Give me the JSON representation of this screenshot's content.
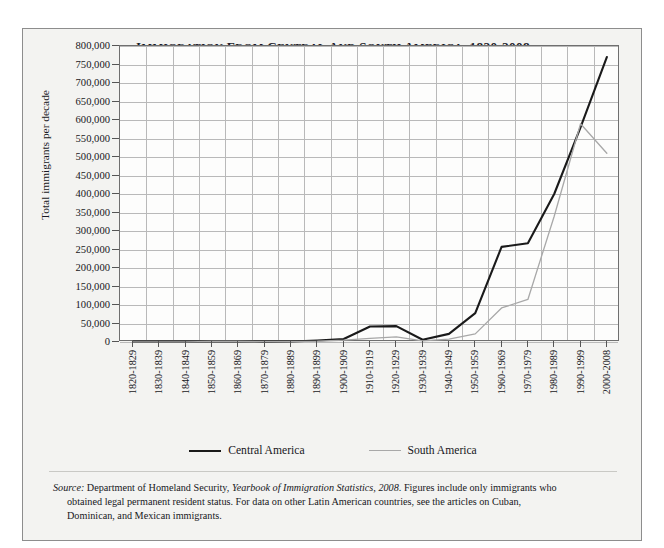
{
  "figure": {
    "title": "Immigration from Central and South America, 1820-2008",
    "y_axis_title": "Total immigrants per decade",
    "source_label": "Source:",
    "source_text_1": " Department of Homeland Security, ",
    "source_italic": "Yearbook of Immigration Statistics, 2008",
    "source_text_2": ". Figures include only immigrants who",
    "source_line_2": "obtained legal permanent resident status. For data on other Latin American countries, see the articles on Cuban,",
    "source_line_3": "Dominican, and Mexican immigrants."
  },
  "colors": {
    "central_america": "#1a1a1a",
    "south_america": "#a8a8a8",
    "grid": "#b9b9b9",
    "frame": "#6f6f6f",
    "panel": "#f3f3f1",
    "plot_bg": "#fdfdfc",
    "text": "#171722"
  },
  "legend": {
    "position": "bottom",
    "items": [
      {
        "label": "Central America",
        "color": "#1a1a1a",
        "width": 2.1
      },
      {
        "label": "South America",
        "color": "#a8a8a8",
        "width": 1.4
      }
    ]
  },
  "chart_data": {
    "type": "line",
    "title": "Immigration from Central and South America, 1820-2008",
    "xlabel": "",
    "ylabel": "Total immigrants per decade",
    "ylim": [
      0,
      800000
    ],
    "ytick_step": 50000,
    "grid": true,
    "categories": [
      "1820-1829",
      "1830-1839",
      "1840-1849",
      "1850-1859",
      "1860-1869",
      "1870-1879",
      "1880-1889",
      "1890-1899",
      "1900-1909",
      "1910-1919",
      "1920-1929",
      "1930-1939",
      "1940-1949",
      "1950-1959",
      "1960-1969",
      "1970-1979",
      "1980-1989",
      "1990-1999",
      "2000-2008"
    ],
    "ytick_labels": [
      "800,000",
      "750,000",
      "700,000",
      "650,000",
      "600,000",
      "550,000",
      "500,000",
      "450,000",
      "400,000",
      "350,000",
      "300,000",
      "250,000",
      "200,000",
      "150,000",
      "100,000",
      "50,000",
      "0"
    ],
    "series": [
      {
        "name": "Central America",
        "color": "#1a1a1a",
        "values": [
          1000,
          1000,
          1000,
          1500,
          1500,
          1000,
          1500,
          4000,
          8000,
          42000,
          43000,
          6000,
          22000,
          78000,
          257000,
          267000,
          400000,
          580000,
          770000
        ]
      },
      {
        "name": "South America",
        "color": "#a8a8a8",
        "values": [
          500,
          500,
          500,
          1500,
          1500,
          1000,
          1000,
          2000,
          5000,
          10000,
          14000,
          3000,
          8000,
          22000,
          92000,
          115000,
          340000,
          590000,
          510000
        ]
      }
    ]
  }
}
